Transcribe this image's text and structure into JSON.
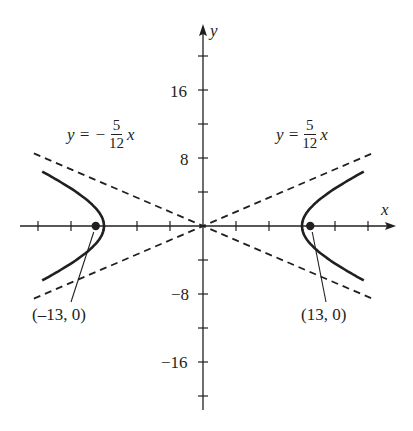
{
  "chart_data": {
    "type": "line",
    "title": "",
    "xlabel": "x",
    "ylabel": "y",
    "xlim": [
      -22,
      22
    ],
    "ylim": [
      -22,
      22
    ],
    "grid": false,
    "x_tick_step": 4,
    "y_tick_step": 4,
    "y_tick_labels": [
      "16",
      "8",
      "-8",
      "-16"
    ],
    "y_tick_label_values": [
      16,
      8,
      -8,
      -16
    ],
    "series": [
      {
        "name": "hyperbola-right-branch",
        "style": "solid",
        "equation": "x = 12*sqrt(1 + y^2/25)",
        "vertex": [
          12,
          0
        ]
      },
      {
        "name": "hyperbola-left-branch",
        "style": "solid",
        "equation": "x = -12*sqrt(1 + y^2/25)",
        "vertex": [
          -12,
          0
        ]
      },
      {
        "name": "asymptote-positive",
        "style": "dashed",
        "equation": "y = (5/12)x"
      },
      {
        "name": "asymptote-negative",
        "style": "dashed",
        "equation": "y = -(5/12)x"
      }
    ],
    "points": [
      {
        "label": "(–13, 0)",
        "x": -13,
        "y": 0
      },
      {
        "label": "(13, 0)",
        "x": 13,
        "y": 0
      }
    ],
    "annotations": [
      {
        "text": "y = −5/12 x",
        "position": "upper-left"
      },
      {
        "text": "y = 5/12 x",
        "position": "upper-right"
      }
    ]
  },
  "axes": {
    "x_label": "x",
    "y_label": "y",
    "ticks": {
      "y16": "16",
      "y8": "8",
      "yneg8": "−8",
      "yneg16": "−16"
    }
  },
  "labels": {
    "asymptote_left": {
      "lhs": "y = −",
      "num": "5",
      "den": "12",
      "var": "x"
    },
    "asymptote_right": {
      "lhs": "y =",
      "num": "5",
      "den": "12",
      "var": "x"
    },
    "focus_left": "(–13, 0)",
    "focus_right": "(13, 0)"
  }
}
